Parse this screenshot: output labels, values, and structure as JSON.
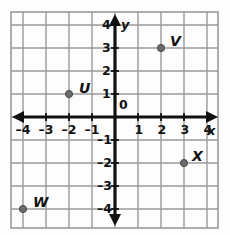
{
  "figure": {
    "kind": "coordinate-plane",
    "origin_label": "0",
    "axis_labels": {
      "x": "x",
      "y": "y"
    }
  },
  "chart_data": {
    "type": "scatter",
    "title": "",
    "xlabel": "x",
    "ylabel": "y",
    "xlim": [
      -4.8,
      4.8
    ],
    "ylim": [
      -4.8,
      4.8
    ],
    "xticks": [
      -4,
      -3,
      -2,
      -1,
      1,
      2,
      3,
      4
    ],
    "yticks": [
      -4,
      -3,
      -2,
      -1,
      1,
      2,
      3,
      4
    ],
    "xtick_labels": [
      "–4",
      "–3",
      "–2",
      "–1",
      "1",
      "2",
      "3",
      "4"
    ],
    "ytick_labels": [
      "–4",
      "–3",
      "–2",
      "–1",
      "1",
      "2",
      "3",
      "4"
    ],
    "grid": true,
    "grid_spacing": 1,
    "legend": false,
    "origin_label": "0",
    "points": [
      {
        "label": "U",
        "x": -2,
        "y": 1,
        "label_dx": 10,
        "label_dy": -13
      },
      {
        "label": "V",
        "x": 2,
        "y": 3,
        "label_dx": 9,
        "label_dy": -14
      },
      {
        "label": "W",
        "x": -4,
        "y": -4,
        "label_dx": 10,
        "label_dy": -14
      },
      {
        "label": "X",
        "x": 3,
        "y": -2,
        "label_dx": 8,
        "label_dy": -14
      }
    ]
  },
  "style": {
    "point_color": "#6b6b6b",
    "point_edge_color": "#4a4a4a",
    "axis_color": "#111111",
    "grid_color": "#9a9a9a",
    "grid_bg": "#fdfdfd",
    "label_color": "#111111"
  }
}
